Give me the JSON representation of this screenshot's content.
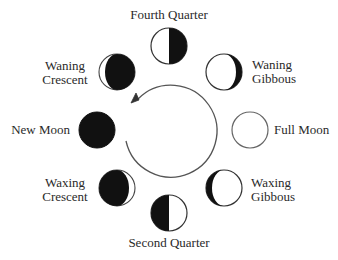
{
  "diagram": {
    "title": "",
    "type": "moon-phases-cycle",
    "colors": {
      "ink": "#111111",
      "outline": "#555555",
      "background": "#ffffff",
      "label": "#2a2a2a"
    },
    "cycle_arrow": {
      "direction": "counterclockwise",
      "center": [
        173,
        130
      ],
      "radius": 46
    },
    "phases": [
      {
        "id": "fourth-quarter",
        "label_line1": "Fourth Quarter",
        "label_line2": "",
        "lit": "left-half",
        "position": "top"
      },
      {
        "id": "waning-gibbous",
        "label_line1": "Waning",
        "label_line2": "Gibbous",
        "lit": "gibbous-left",
        "position": "top-right"
      },
      {
        "id": "full-moon",
        "label_line1": "Full Moon",
        "label_line2": "",
        "lit": "full",
        "position": "right"
      },
      {
        "id": "waxing-gibbous",
        "label_line1": "Waxing",
        "label_line2": "Gibbous",
        "lit": "gibbous-right",
        "position": "bottom-right"
      },
      {
        "id": "second-quarter",
        "label_line1": "Second Quarter",
        "label_line2": "",
        "lit": "right-half",
        "position": "bottom"
      },
      {
        "id": "waxing-crescent",
        "label_line1": "Waxing",
        "label_line2": "Crescent",
        "lit": "crescent-right",
        "position": "bottom-left"
      },
      {
        "id": "new-moon",
        "label_line1": "New Moon",
        "label_line2": "",
        "lit": "none",
        "position": "left"
      },
      {
        "id": "waning-crescent",
        "label_line1": "Waning",
        "label_line2": "Crescent",
        "lit": "crescent-left",
        "position": "top-left"
      }
    ]
  }
}
